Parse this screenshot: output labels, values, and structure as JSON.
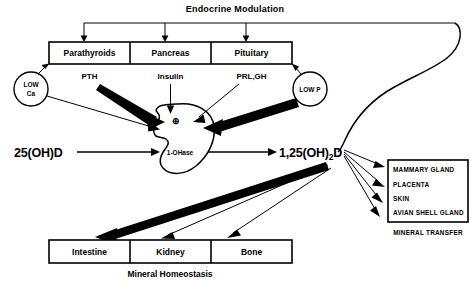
{
  "diagram": {
    "title": "Endocrine Modulation",
    "bottom_caption": "Mineral Homeostasis",
    "right_caption": "MINERAL TRANSFER",
    "endocrine_glands": [
      {
        "label": "Parathyroids"
      },
      {
        "label": "Pancreas"
      },
      {
        "label": "Pituitary"
      }
    ],
    "hormones": [
      {
        "label": "PTH"
      },
      {
        "label": "Insulin"
      },
      {
        "label": "PRL,GH"
      }
    ],
    "stimuli": [
      {
        "line1": "LOW",
        "line2": "Ca"
      },
      {
        "line1": "LOW P",
        "line2": ""
      }
    ],
    "enzyme": {
      "label": "1-OHase"
    },
    "metabolites": {
      "substrate": "25(OH)D",
      "product_main": "1,25(OH)",
      "product_sub": "2",
      "product_tail": "D"
    },
    "plus_sign": "⊕",
    "target_organs": [
      {
        "label": "Intestine"
      },
      {
        "label": "Kidney"
      },
      {
        "label": "Bone"
      }
    ],
    "mineral_transfer_tissues": [
      {
        "label": "MAMMARY GLAND"
      },
      {
        "label": "PLACENTA"
      },
      {
        "label": "SKIN"
      },
      {
        "label": "AVIAN SHELL GLAND"
      }
    ],
    "colors": {
      "ink": "#000000",
      "paper": "#ffffff"
    }
  }
}
